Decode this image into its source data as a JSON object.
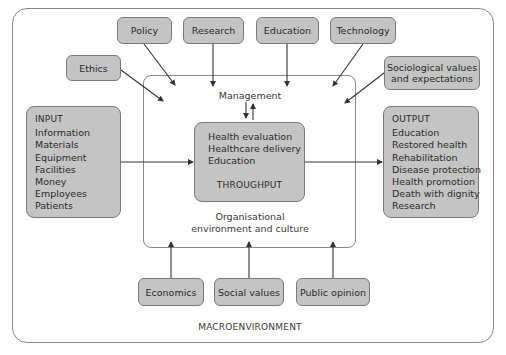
{
  "diagram": {
    "type": "systems model",
    "outer_label": "MACROENVIRONMENT",
    "inner_label_line1": "Organisational",
    "inner_label_line2": "environment and culture",
    "management_label": "Management",
    "top_factors": {
      "policy": "Policy",
      "research": "Research",
      "education": "Education",
      "technology": "Technology",
      "ethics": "Ethics",
      "sociological_line1": "Sociological values",
      "sociological_line2": "and expectations"
    },
    "bottom_factors": {
      "economics": "Economics",
      "social_values": "Social values",
      "public_opinion": "Public opinion"
    },
    "input": {
      "title": "INPUT",
      "items": [
        "Information",
        "Materials",
        "Equipment",
        "Facilities",
        "Money",
        "Employees",
        "Patients"
      ]
    },
    "throughput": {
      "title": "THROUGHPUT",
      "items": [
        "Health evaluation",
        "Healthcare delivery",
        "Education"
      ]
    },
    "output": {
      "title": "OUTPUT",
      "items": [
        "Education",
        "Restored health",
        "Rehabilitation",
        "Disease protection",
        "Health promotion",
        "Death with dignity",
        "Research"
      ]
    },
    "colors": {
      "box_fill": "#c4c4c4",
      "box_border": "#7a7a7a",
      "frame_border": "#8a8a8a",
      "arrow": "#333333"
    }
  }
}
